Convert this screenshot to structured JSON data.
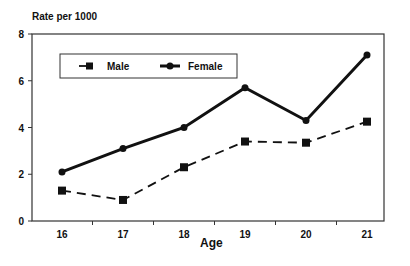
{
  "chart_data": {
    "type": "line",
    "title": "",
    "ylabel": "Rate per 1000",
    "xlabel": "Age",
    "x": [
      16,
      17,
      18,
      19,
      20,
      21
    ],
    "categories": [
      "16",
      "17",
      "18",
      "19",
      "20",
      "21"
    ],
    "ylim": [
      0,
      8
    ],
    "yticks": [
      0,
      2,
      4,
      6,
      8
    ],
    "grid": false,
    "legend_position": "top-left inside plot",
    "series": [
      {
        "name": "Male",
        "style": "dashed",
        "marker": "square",
        "values": [
          1.3,
          0.9,
          2.3,
          3.4,
          3.35,
          4.25
        ]
      },
      {
        "name": "Female",
        "style": "solid",
        "marker": "circle",
        "values": [
          2.1,
          3.1,
          4.0,
          5.7,
          4.3,
          7.1
        ]
      }
    ]
  },
  "colors": {
    "line": "#111111",
    "axis": "#333333",
    "background": "#ffffff"
  }
}
